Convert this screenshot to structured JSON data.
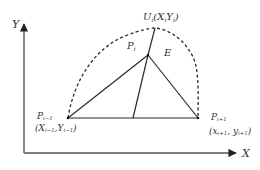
{
  "axes": {
    "x_label": "X",
    "y_label": "Y"
  },
  "points": {
    "p_prev": {
      "name": "P",
      "sub": "i−1",
      "coord_open": "(",
      "x_name": "X",
      "x_sub": "i−1",
      "sep": ",",
      "y_name": "Y",
      "y_sub": "i−1",
      "coord_close": ")"
    },
    "p_next": {
      "name": "P",
      "sub": "i+1",
      "coord_open": "(",
      "x_name": "x",
      "x_sub": "i+1",
      "sep": ", ",
      "y_name": "y",
      "y_sub": "i+1",
      "coord_close": ")"
    },
    "p_i": {
      "name": "P",
      "sub": "i"
    },
    "u_i": {
      "name": "U",
      "sub": "i",
      "open": "(",
      "x_name": "X",
      "x_sub": "i",
      "y_name": "Y",
      "y_sub": "i",
      "close": ")"
    }
  },
  "region_label": "E",
  "colors": {
    "line": "#2a2a2a",
    "axis": "#555555",
    "text": "#333333"
  }
}
